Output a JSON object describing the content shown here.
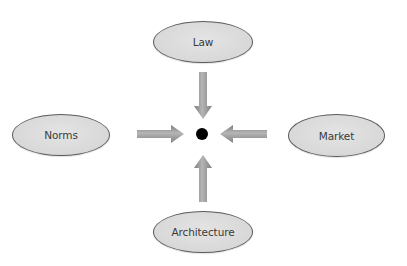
{
  "diagram": {
    "title": "",
    "center": {
      "shape": "dot",
      "color": "#000000"
    },
    "nodes": {
      "top": {
        "label": "Law"
      },
      "left": {
        "label": "Norms"
      },
      "right": {
        "label": "Market"
      },
      "bottom": {
        "label": "Architecture"
      }
    },
    "arrows": [
      {
        "from": "Law",
        "to": "center",
        "direction": "down"
      },
      {
        "from": "Norms",
        "to": "center",
        "direction": "right"
      },
      {
        "from": "Market",
        "to": "center",
        "direction": "left"
      },
      {
        "from": "Architecture",
        "to": "center",
        "direction": "up"
      }
    ],
    "colors": {
      "node_fill": "#d9d9d9",
      "node_border": "#5a5a5a",
      "arrow_fill": "#9a9a9a",
      "label_text": "#3a3a3a",
      "dot": "#000000"
    }
  }
}
